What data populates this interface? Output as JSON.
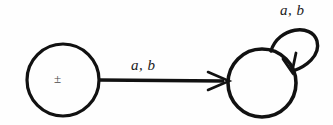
{
  "diagram": {
    "type": "state-transition-diagram",
    "background_color": "#fefefe",
    "stroke_color": "#111111",
    "states": [
      {
        "id": "start",
        "name": "start-state",
        "label": "±",
        "cx": 63,
        "cy": 80,
        "r": 36,
        "stroke_width": 3
      },
      {
        "id": "accept",
        "name": "right-state",
        "label": "",
        "cx": 262,
        "cy": 83,
        "r": 34,
        "stroke_width": 3.5
      }
    ],
    "transitions": [
      {
        "id": "t1",
        "name": "transition-start-to-right",
        "from": "start",
        "to": "accept",
        "label": "a, b",
        "kind": "straight",
        "x1": 99,
        "y1": 80,
        "x2": 228,
        "y2": 81
      },
      {
        "id": "t2",
        "name": "self-loop-right-state",
        "from": "accept",
        "to": "accept",
        "label": "a, b",
        "kind": "self-loop"
      }
    ]
  }
}
